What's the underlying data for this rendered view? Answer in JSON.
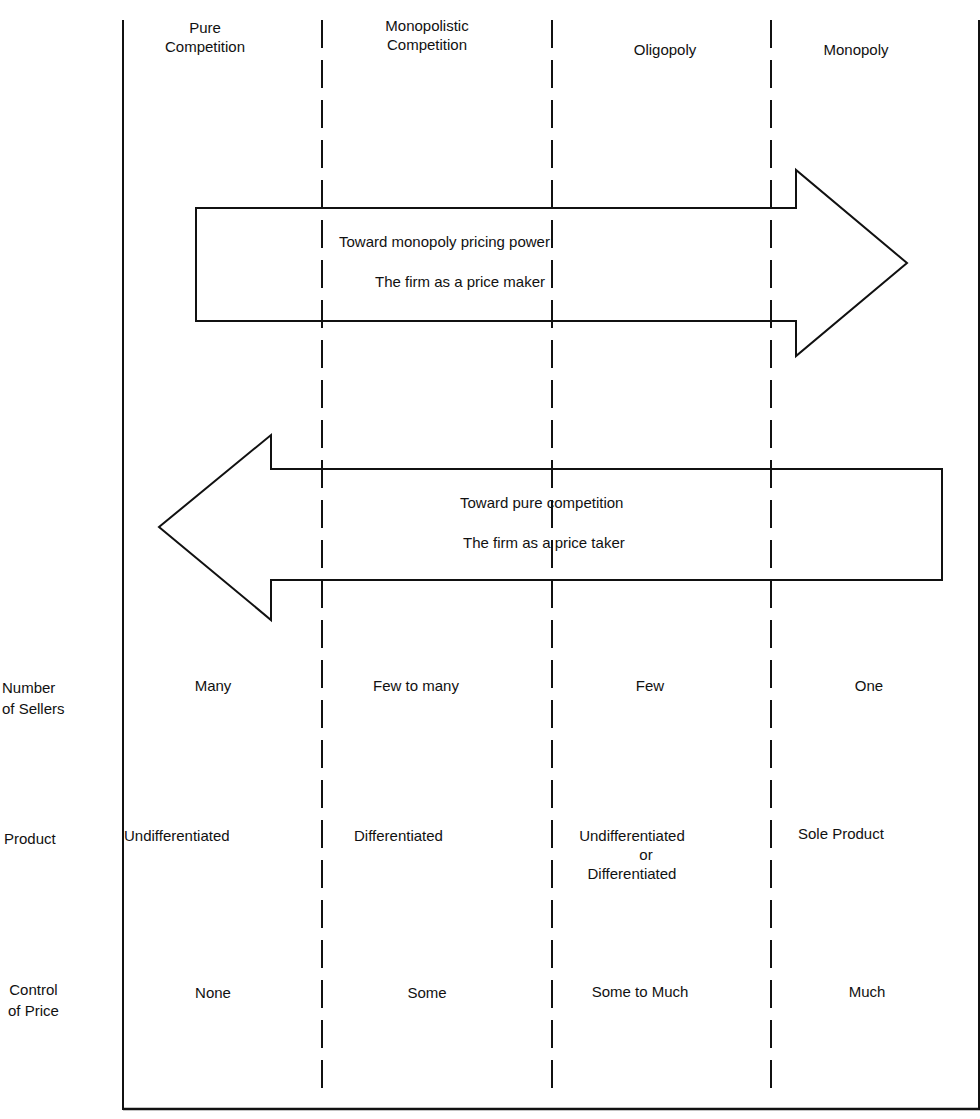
{
  "diagram": {
    "columns": [
      {
        "label_line1": "Pure",
        "label_line2": "Competition"
      },
      {
        "label_line1": "Monopolistic",
        "label_line2": "Competition"
      },
      {
        "label_line1": "",
        "label_line2": "Oligopoly"
      },
      {
        "label_line1": "",
        "label_line2": "Monopoly"
      }
    ],
    "arrows": {
      "right": {
        "line1": "Toward monopoly pricing power",
        "line2": "The firm as a price maker"
      },
      "left": {
        "line1": "Toward pure competition",
        "line2": "The firm as a price taker"
      }
    },
    "rows": [
      {
        "label_line1": "Number",
        "label_line2": "of Sellers",
        "values": [
          "Many",
          "Few to many",
          "Few",
          "One"
        ]
      },
      {
        "label_line1": "Product",
        "label_line2": "",
        "values": [
          "Undifferentiated",
          "Differentiated",
          "Undifferentiated",
          "Sole Product"
        ],
        "extra": {
          "or": "or",
          "alt": "Differentiated"
        }
      },
      {
        "label_line1": "Control",
        "label_line2": "of Price",
        "values": [
          "None",
          "Some",
          "Some to Much",
          "Much"
        ]
      }
    ],
    "colors": {
      "line": "#111111",
      "background": "#ffffff"
    }
  }
}
